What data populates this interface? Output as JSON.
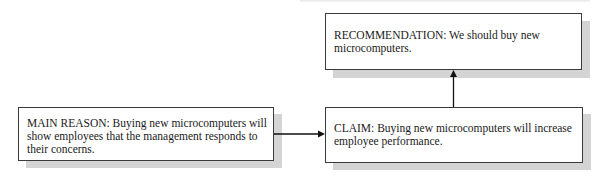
{
  "diagram": {
    "type": "argument-flow",
    "nodes": [
      {
        "id": "recommendation",
        "label": "RECOMMENDATION",
        "text": "RECOMMENDATION: We should buy new microcomputers."
      },
      {
        "id": "main_reason",
        "label": "MAIN REASON",
        "text": "MAIN REASON: Buying new microcomputers will show employees that the management responds to their concerns."
      },
      {
        "id": "claim",
        "label": "CLAIM",
        "text": "CLAIM: Buying new microcomputers will increase employee performance."
      }
    ],
    "edges": [
      {
        "from": "main_reason",
        "to": "claim",
        "direction": "right"
      },
      {
        "from": "claim",
        "to": "recommendation",
        "direction": "up"
      }
    ],
    "colors": {
      "border": "#3a3a3a",
      "shadow": "#d4d4d4",
      "arrow": "#111111",
      "background": "#ffffff"
    }
  }
}
